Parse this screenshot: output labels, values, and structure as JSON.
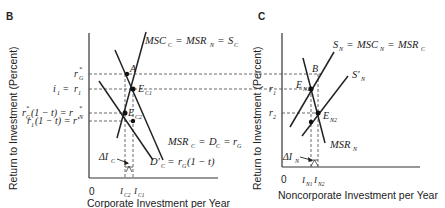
{
  "panels": [
    {
      "id": "B",
      "label": "B",
      "y_axis_label": "Return to Investment (Percent)",
      "x_axis_label": "Corporate Investment per Year",
      "origin": "0",
      "y_ticks": [
        "r*G",
        "i1 = r1",
        "r*G(1 − t) = r*N",
        "r1(1 − t) = r′"
      ],
      "x_ticks": [
        "IC2",
        "IC1"
      ],
      "curves": [
        "MSCC = MSRN = SC",
        "MSRC = DC = rG",
        "D′C = rG(1 − t)"
      ],
      "points": [
        "A",
        "EC1",
        "EC2"
      ],
      "annotation": "ΔIC"
    },
    {
      "id": "C",
      "label": "C",
      "y_axis_label": "Return to Investment (Percent)",
      "x_axis_label": "Noncorporate Investment per Year",
      "origin": "0",
      "y_ticks": [
        "r1",
        "r2"
      ],
      "x_ticks": [
        "IN1",
        "IN2"
      ],
      "curves": [
        "SN = MSCN = MSRC",
        "S′N",
        "MSRN"
      ],
      "points": [
        "B",
        "EN1",
        "EN2"
      ],
      "annotation": "ΔIN"
    }
  ],
  "text": {
    "panel_b": "B",
    "panel_c": "C",
    "y_label_b": "Return to Investment (Percent)",
    "y_label_c": "Return to Investment (Percent)",
    "x_label_b": "Corporate Investment per Year",
    "x_label_c": "Noncorporate Investment per Year",
    "zero": "0"
  }
}
